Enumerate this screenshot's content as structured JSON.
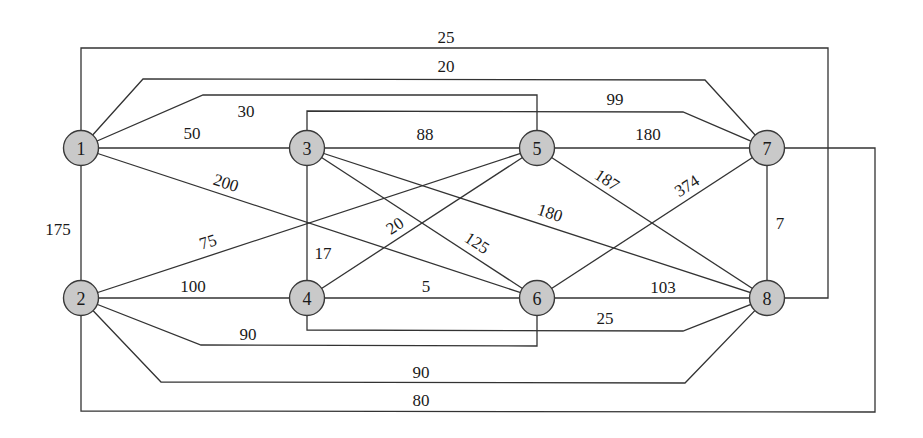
{
  "diagram": {
    "type": "weighted-undirected-graph",
    "node_fill": "#c9c9c9",
    "node_stroke": "#3a3a3a",
    "edge_color": "#333333",
    "nodes": [
      {
        "id": "1",
        "label": "1",
        "x": 81,
        "y": 148
      },
      {
        "id": "2",
        "label": "2",
        "x": 81,
        "y": 298
      },
      {
        "id": "3",
        "label": "3",
        "x": 307,
        "y": 148
      },
      {
        "id": "4",
        "label": "4",
        "x": 307,
        "y": 298
      },
      {
        "id": "5",
        "label": "5",
        "x": 537,
        "y": 148
      },
      {
        "id": "6",
        "label": "6",
        "x": 537,
        "y": 298
      },
      {
        "id": "7",
        "label": "7",
        "x": 767,
        "y": 148
      },
      {
        "id": "8",
        "label": "8",
        "x": 767,
        "y": 298
      }
    ],
    "edges": [
      {
        "from": "1",
        "to": "8",
        "weight": "25",
        "points": "81,148 81,48 828,48 828,298 767,298",
        "lx": 446,
        "ly": 37,
        "rot": 0
      },
      {
        "from": "1",
        "to": "7",
        "weight": "20",
        "points": "81,148 143,79 705,80 767,148",
        "lx": 446,
        "ly": 66,
        "rot": 0
      },
      {
        "from": "1",
        "to": "5",
        "weight": "30",
        "points": "81,148 203,95 537,95 537,148",
        "lx": 246,
        "ly": 111,
        "rot": 0
      },
      {
        "from": "1",
        "to": "3",
        "weight": "50",
        "points": "81,148 307,148",
        "lx": 192,
        "ly": 133,
        "rot": 0
      },
      {
        "from": "1",
        "to": "6",
        "weight": "200",
        "points": "81,148 537,298",
        "lx": 226,
        "ly": 183,
        "rot": 18
      },
      {
        "from": "1",
        "to": "2",
        "weight": "175",
        "points": "81,148 81,298",
        "lx": 58,
        "ly": 229,
        "rot": 0
      },
      {
        "from": "3",
        "to": "7",
        "weight": "99",
        "points": "307,148 307,111 683,112 767,148",
        "lx": 615,
        "ly": 99,
        "rot": 0
      },
      {
        "from": "3",
        "to": "5",
        "weight": "88",
        "points": "307,148 537,148",
        "lx": 425,
        "ly": 134,
        "rot": 0
      },
      {
        "from": "5",
        "to": "7",
        "weight": "180",
        "points": "537,148 767,148",
        "lx": 648,
        "ly": 134,
        "rot": 0
      },
      {
        "from": "3",
        "to": "4",
        "weight": "17",
        "points": "307,148 307,298",
        "lx": 323,
        "ly": 253,
        "rot": 0
      },
      {
        "from": "3",
        "to": "6",
        "weight": "125",
        "points": "307,148 537,298",
        "lx": 477,
        "ly": 243,
        "rot": 33
      },
      {
        "from": "3",
        "to": "8",
        "weight": "180",
        "points": "307,148 767,298",
        "lx": 550,
        "ly": 213,
        "rot": 18
      },
      {
        "from": "5",
        "to": "2",
        "weight": "75",
        "points": "537,148 81,298",
        "lx": 208,
        "ly": 242,
        "rot": -18
      },
      {
        "from": "5",
        "to": "4",
        "weight": "20",
        "points": "537,148 307,298",
        "lx": 395,
        "ly": 226,
        "rot": -33
      },
      {
        "from": "5",
        "to": "8",
        "weight": "187",
        "points": "537,148 767,298",
        "lx": 607,
        "ly": 180,
        "rot": 33
      },
      {
        "from": "6",
        "to": "7",
        "weight": "374",
        "points": "537,298 767,148",
        "lx": 687,
        "ly": 186,
        "rot": -33
      },
      {
        "from": "7",
        "to": "8",
        "weight": "7",
        "points": "767,148 767,298",
        "lx": 780,
        "ly": 223,
        "rot": 0
      },
      {
        "from": "2",
        "to": "4",
        "weight": "100",
        "points": "81,298 307,298",
        "lx": 193,
        "ly": 286,
        "rot": 0
      },
      {
        "from": "4",
        "to": "6",
        "weight": "5",
        "points": "307,298 537,298",
        "lx": 426,
        "ly": 286,
        "rot": 0
      },
      {
        "from": "6",
        "to": "8",
        "weight": "103",
        "points": "537,298 767,298",
        "lx": 663,
        "ly": 287,
        "rot": 0
      },
      {
        "from": "4",
        "to": "8",
        "weight": "25",
        "points": "307,298 307,330 683,331 767,298",
        "lx": 605,
        "ly": 318,
        "rot": 0
      },
      {
        "from": "2",
        "to": "6",
        "weight": "90",
        "points": "81,298 201,345 537,346 537,298",
        "lx": 248,
        "ly": 334,
        "rot": 0
      },
      {
        "from": "2",
        "to": "8",
        "weight": "90",
        "points": "81,298 161,382 685,383 767,298",
        "lx": 421,
        "ly": 372,
        "rot": 0
      },
      {
        "from": "2",
        "to": "7",
        "weight": "80",
        "points": "81,298 81,411 875,412 875,148 767,148",
        "lx": 421,
        "ly": 400,
        "rot": 0
      }
    ]
  }
}
